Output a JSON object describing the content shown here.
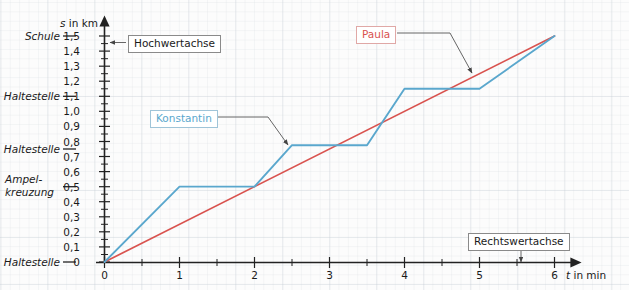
{
  "chart_data": {
    "type": "line",
    "title": "",
    "xlabel": "t in min",
    "ylabel": "s in km",
    "xlim": [
      0,
      6.35
    ],
    "ylim": [
      0,
      1.55
    ],
    "grid": true,
    "legend_position": "inline-callouts",
    "x_ticks": [
      "0",
      "1",
      "2",
      "3",
      "4",
      "5",
      "6"
    ],
    "x_tick_values": [
      0,
      1,
      2,
      3,
      4,
      5,
      6
    ],
    "y_ticks": [
      "0",
      "0,1",
      "0,2",
      "0,3",
      "0,4",
      "0,5",
      "0,6",
      "0,7",
      "0,8",
      "0,9",
      "1,0",
      "1,1",
      "1,2",
      "1,3",
      "1,4",
      "1,5"
    ],
    "y_tick_values": [
      0,
      0.1,
      0.2,
      0.3,
      0.4,
      0.5,
      0.6,
      0.7,
      0.8,
      0.9,
      1.0,
      1.1,
      1.2,
      1.3,
      1.4,
      1.5
    ],
    "series": [
      {
        "name": "Konstantin",
        "color": "#5aa7cd",
        "points": [
          [
            0,
            0
          ],
          [
            1,
            0.5
          ],
          [
            2,
            0.5
          ],
          [
            2.5,
            0.775
          ],
          [
            3.5,
            0.775
          ],
          [
            4,
            1.15
          ],
          [
            5,
            1.15
          ],
          [
            6,
            1.5
          ]
        ]
      },
      {
        "name": "Paula",
        "color": "#d9534f",
        "points": [
          [
            0,
            0
          ],
          [
            6,
            1.5
          ]
        ]
      }
    ],
    "category_markers": [
      {
        "label": "Schule",
        "value": 1.5
      },
      {
        "label": "Haltestelle",
        "value": 1.15
      },
      {
        "label": "Haltestelle",
        "value": 0.775
      },
      {
        "label": "Ampel-\nkreuzung",
        "value": 0.5
      },
      {
        "label": "Haltestelle",
        "value": 0
      }
    ],
    "annotations": [
      {
        "text": "Hochwertachse",
        "kind": "axis-callout",
        "points_to": "y-axis"
      },
      {
        "text": "Rechtswertachse",
        "kind": "axis-callout",
        "points_to": "x-axis"
      },
      {
        "text": "Konstantin",
        "kind": "series-callout",
        "points_to": "Konstantin"
      },
      {
        "text": "Paula",
        "kind": "series-callout",
        "points_to": "Paula"
      }
    ]
  },
  "axes": {
    "y_title": "s in km",
    "y_title_italic": "s",
    "y_title_rest": " in km",
    "x_title": "t in min",
    "x_title_italic": "t",
    "x_title_rest": " in min"
  },
  "y_labels": {
    "t0": "0",
    "t1": "0,1",
    "t2": "0,2",
    "t3": "0,3",
    "t4": "0,4",
    "t5": "0,5",
    "t6": "0,6",
    "t7": "0,7",
    "t8": "0,8",
    "t9": "0,9",
    "t10": "1,0",
    "t11": "1,1",
    "t12": "1,2",
    "t13": "1,3",
    "t14": "1,4",
    "t15": "1,5"
  },
  "x_labels": {
    "t0": "0",
    "t1": "1",
    "t2": "2",
    "t3": "3",
    "t4": "4",
    "t5": "5",
    "t6": "6"
  },
  "categories": {
    "schule": "Schule",
    "haltestelle_top": "Haltestelle",
    "haltestelle_mid": "Haltestelle",
    "ampel_line1": "Ampel-",
    "ampel_line2": "kreuzung",
    "haltestelle_bottom": "Haltestelle"
  },
  "callouts": {
    "hochwertachse": "Hochwertachse",
    "rechtswertachse": "Rechtswertachse",
    "konstantin": "Konstantin",
    "paula": "Paula"
  },
  "colors": {
    "konstantin": "#5aa7cd",
    "paula": "#d9534f",
    "axis": "#222222",
    "grid": "#c9d2da",
    "text": "#1a1a1a"
  }
}
